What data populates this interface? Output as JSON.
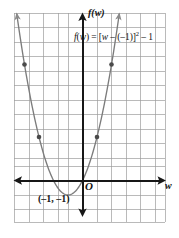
{
  "figure": {
    "background_color": "#ffffff",
    "grid_color": "#9a9a9a",
    "axis_color": "#171717",
    "curve_color": "#7c7c7c",
    "point_color": "#4a4a4a",
    "text_color": "#121212"
  },
  "labels": {
    "y_axis": "f(w)",
    "x_axis": "w",
    "origin": "O",
    "vertex": "(–1, –1)",
    "equation_plain": "f(w) = [w – (–1)]² – 1",
    "equation_parts": {
      "fn": "f",
      "open": "(",
      "var1": "w",
      "close": ")",
      "equals": " = [",
      "var2": "w",
      "minus1": " – (",
      "neg_one": "–1",
      "bracket_close": ")]",
      "exponent": "2",
      "tail": " – 1"
    }
  },
  "chart_data": {
    "type": "line",
    "subtype": "parabola",
    "title": "",
    "equation": "f(w) = [w – (–1)]² – 1",
    "expanded_form": "f(w) = (w + 1)² – 1",
    "xlabel": "w",
    "ylabel": "f(w)",
    "vertex": [
      -1,
      -1
    ],
    "axis_of_symmetry": -1,
    "opens": "up",
    "xlim": [
      -5,
      6
    ],
    "ylim": [
      -3,
      12
    ],
    "grid": true,
    "legend": "none",
    "x_roots": [
      -2,
      0
    ],
    "plotted_points": [
      {
        "x": -4,
        "y": 8
      },
      {
        "x": -3,
        "y": 3
      },
      {
        "x": 1,
        "y": 3
      },
      {
        "x": 2,
        "y": 8
      }
    ],
    "curve_points": [
      {
        "x": -4.5,
        "y": 11.25
      },
      {
        "x": -4,
        "y": 8
      },
      {
        "x": -3.5,
        "y": 5.25
      },
      {
        "x": -3,
        "y": 3
      },
      {
        "x": -2.5,
        "y": 1.25
      },
      {
        "x": -2,
        "y": 0
      },
      {
        "x": -1.5,
        "y": -0.75
      },
      {
        "x": -1,
        "y": -1
      },
      {
        "x": -0.5,
        "y": -0.75
      },
      {
        "x": 0,
        "y": 0
      },
      {
        "x": 0.5,
        "y": 1.25
      },
      {
        "x": 1,
        "y": 3
      },
      {
        "x": 1.5,
        "y": 5.25
      },
      {
        "x": 2,
        "y": 8
      },
      {
        "x": 2.5,
        "y": 11.25
      }
    ]
  },
  "geometry": {
    "grid_spacing_px": 14.5,
    "grid_left_px": 14,
    "grid_right_px": 165,
    "grid_top_px": 13,
    "grid_bottom_px": 222,
    "origin_px": [
      82.5,
      180.5
    ]
  }
}
